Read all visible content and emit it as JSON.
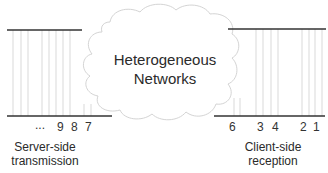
{
  "diagram": {
    "cloud_label_line1": "Heterogeneous",
    "cloud_label_line2": "Networks",
    "server": {
      "label_line1": "Server-side",
      "label_line2": "transmission",
      "packet_numbers": [
        "...",
        "9",
        "8",
        "7"
      ]
    },
    "client": {
      "label_line1": "Client-side",
      "label_line2": "reception",
      "packet_numbers": [
        "6",
        "3",
        "4",
        "2",
        "1"
      ]
    },
    "colors": {
      "line": "#333333",
      "packet_line": "#c8c8c8",
      "cloud_outline": "#d0d0d0"
    }
  }
}
